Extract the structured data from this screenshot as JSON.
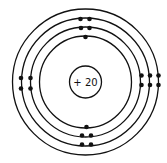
{
  "diagram": {
    "type": "bohr-model",
    "nucleus": {
      "label": "+ 20",
      "charge": 20
    },
    "shells": [
      {
        "index": 1,
        "electrons": 2
      },
      {
        "index": 2,
        "electrons": 8
      },
      {
        "index": 3,
        "electrons": 8
      },
      {
        "index": 4,
        "electrons": 2
      }
    ],
    "colors": {
      "stroke": "#111111",
      "background": "#ffffff"
    }
  }
}
